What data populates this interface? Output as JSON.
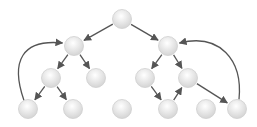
{
  "diagram": {
    "type": "tree-graph",
    "node_radius": 9.5,
    "colors": {
      "background": "#ffffff",
      "node_fill_center": "#ffffff",
      "node_fill_edge": "#d4d4d4",
      "node_stroke": "#cfcfcf",
      "edge": "#555555"
    },
    "nodes": [
      {
        "id": "root",
        "x": 122,
        "y": 19
      },
      {
        "id": "l1a",
        "x": 74,
        "y": 46
      },
      {
        "id": "l1b",
        "x": 168,
        "y": 46
      },
      {
        "id": "l2a",
        "x": 51,
        "y": 78
      },
      {
        "id": "l2b",
        "x": 96,
        "y": 78
      },
      {
        "id": "l2c",
        "x": 145,
        "y": 78
      },
      {
        "id": "l2d",
        "x": 188,
        "y": 78
      },
      {
        "id": "l3a",
        "x": 28,
        "y": 109
      },
      {
        "id": "l3b",
        "x": 73,
        "y": 109
      },
      {
        "id": "l3c",
        "x": 122,
        "y": 109
      },
      {
        "id": "l3d",
        "x": 168,
        "y": 109
      },
      {
        "id": "l3e",
        "x": 206,
        "y": 109
      },
      {
        "id": "l3f",
        "x": 237,
        "y": 109
      }
    ],
    "edges": [
      {
        "from": "root",
        "to": "l1a",
        "kind": "straight"
      },
      {
        "from": "root",
        "to": "l1b",
        "kind": "straight"
      },
      {
        "from": "l1a",
        "to": "l2a",
        "kind": "straight"
      },
      {
        "from": "l1a",
        "to": "l2b",
        "kind": "straight"
      },
      {
        "from": "l1b",
        "to": "l2c",
        "kind": "straight"
      },
      {
        "from": "l1b",
        "to": "l2d",
        "kind": "straight"
      },
      {
        "from": "l2a",
        "to": "l3a",
        "kind": "straight"
      },
      {
        "from": "l2a",
        "to": "l3b",
        "kind": "straight"
      },
      {
        "from": "l2c",
        "to": "l3d",
        "kind": "straight"
      },
      {
        "from": "l3d",
        "to": "l2d",
        "kind": "straight"
      },
      {
        "from": "l2d",
        "to": "l3f",
        "kind": "straight"
      },
      {
        "from": "l3a",
        "to": "l1a",
        "kind": "curve-left"
      },
      {
        "from": "l3f",
        "to": "l1b",
        "kind": "curve-right"
      }
    ]
  }
}
